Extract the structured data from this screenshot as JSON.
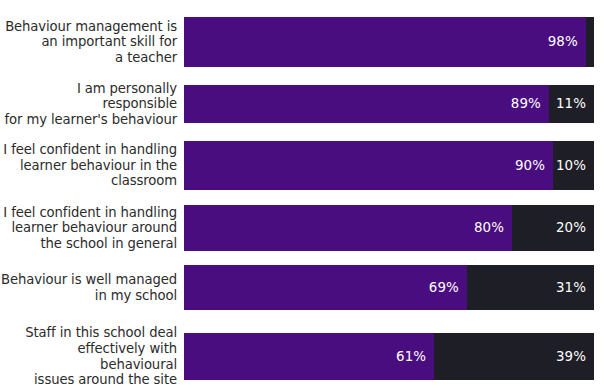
{
  "chart_data": {
    "type": "bar",
    "subtype": "stacked-horizontal-100pct",
    "title": "",
    "xlabel": "",
    "ylabel": "",
    "xlim": [
      0,
      100
    ],
    "grid": false,
    "legend": "none",
    "value_suffix": "%",
    "categories": [
      "Behaviour management is\nan important skill for\na teacher",
      "I am personally responsible\nfor my learner's behaviour",
      "I feel confident in handling\nlearner behaviour in the\nclassroom",
      "I feel confident in handling\nlearner behaviour around\nthe school in general",
      "Behaviour is well managed\nin my school",
      "Staff in this school deal\neffectively with behavioural\nissues around the site"
    ],
    "series": [
      {
        "name": "Agree",
        "color": "#4a0d80",
        "values": [
          98,
          89,
          90,
          80,
          69,
          61
        ],
        "labels": [
          "98%",
          "89%",
          "90%",
          "80%",
          "69%",
          "61%"
        ]
      },
      {
        "name": "Disagree",
        "color": "#1e1e26",
        "values": [
          2,
          11,
          10,
          20,
          31,
          39
        ],
        "labels": [
          "2%",
          "11%",
          "10%",
          "20%",
          "31%",
          "39%"
        ]
      }
    ]
  },
  "colors": {
    "agree": "#4a0d80",
    "disagree": "#1e1e26",
    "label_text": "#2b2b2b",
    "value_text": "#ffffff",
    "background": "#ffffff"
  },
  "rows": [
    {
      "top": 17,
      "height": 50
    },
    {
      "top": 85,
      "height": 38
    },
    {
      "top": 141,
      "height": 49
    },
    {
      "top": 205,
      "height": 46
    },
    {
      "top": 265,
      "height": 45
    },
    {
      "top": 333,
      "height": 47
    }
  ],
  "geometry": {
    "bar_start_x": 190,
    "bar_end_x": 600,
    "label_width": 184
  }
}
